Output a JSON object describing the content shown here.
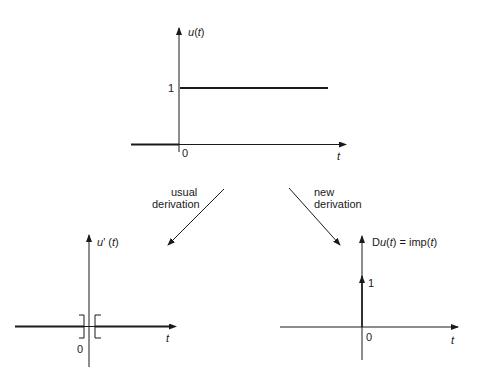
{
  "top_graph": {
    "ylabel": "u(t)",
    "ylabel_fn": "u",
    "ytick": "1",
    "origin": "0",
    "xlabel": "t"
  },
  "arrows": {
    "left_label_line1": "usual",
    "left_label_line2": "derivation",
    "right_label_line1": "new",
    "right_label_line2": "derivation"
  },
  "bottom_left_graph": {
    "ylabel": "u' (t)",
    "origin": "0",
    "xlabel": "t"
  },
  "bottom_right_graph": {
    "ylabel_prefix": "D",
    "ylabel_fn": "u",
    "ylabel_rest": "(t) = imp(t)",
    "impulse_height": "1",
    "origin": "0",
    "xlabel": "t"
  },
  "colors": {
    "line": "#1a1a1a",
    "background": "#ffffff"
  }
}
